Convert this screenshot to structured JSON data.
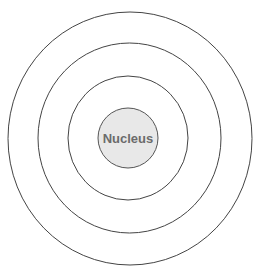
{
  "diagram": {
    "title": "",
    "nucleus": {
      "label": "Nucleus",
      "fill": "#e8e8e8",
      "stroke": "#555555"
    },
    "rings": [
      {
        "name": "shell-1",
        "rx": 60,
        "ry": 62
      },
      {
        "name": "shell-2",
        "rx": 92,
        "ry": 95
      },
      {
        "name": "shell-3",
        "rx": 122,
        "ry": 126
      }
    ],
    "center": {
      "x": 130,
      "y": 138
    },
    "stroke_color": "#444444"
  }
}
